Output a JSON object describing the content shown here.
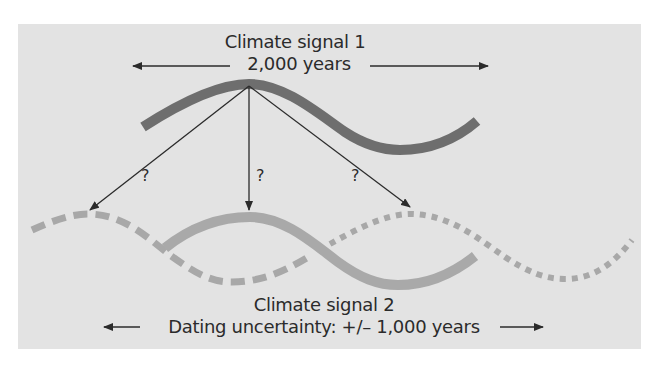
{
  "signal1": {
    "title": "Climate signal 1",
    "period_label": "2,000 years"
  },
  "signal2": {
    "title": "Climate signal 2",
    "uncertainty_label": "Dating uncertainty: +/– 1,000 years"
  },
  "question_marks": [
    "?",
    "?",
    "?"
  ],
  "colors": {
    "panel_background": "#e3e3e3",
    "signal1_curve": "#6e6e6e",
    "signal2_curve": "#a9a9a9",
    "arrows": "#2b2b2b",
    "text": "#2b2b2b"
  },
  "curves": {
    "signal1": "solid dark wave, one period",
    "signal2_best_match": "solid light wave aligned with signal 1 peak",
    "signal2_earlier_alignment": "dashed light wave shifted left",
    "signal2_later_alignment": "dotted light wave shifted right"
  }
}
